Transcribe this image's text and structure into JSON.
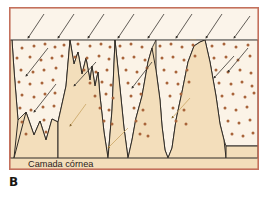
{
  "figure": {
    "panel_label": "B",
    "caption": "Camada córnea",
    "caption_position": {
      "x": 28,
      "y": 167
    },
    "frame": {
      "x": 9,
      "y": 7,
      "width": 250,
      "height": 163,
      "border_color": "#c4705c",
      "border_width": 1.6
    },
    "colors": {
      "outer_background": "#ffffff",
      "upper_band_fill": "#fbf4ea",
      "cell_region_fill": "#fbf3e7",
      "keratin_fill": "#f3debb",
      "dot_color": "#a8643a",
      "outline_color": "#2f2b26",
      "boundary_line_color": "#8d8b86",
      "arrow_dark": "#3a3631",
      "arrow_tan": "#c9a463",
      "text_color": "#2b2119",
      "frame_border": "#c4705c"
    },
    "boundary_line": {
      "y": 39.5,
      "segments": [
        [
          10,
          190
        ],
        [
          196,
          258
        ]
      ]
    }
  },
  "chart_data": {
    "type": "diagram",
    "title": "Camada córnea",
    "keratin_polygons": [
      {
        "name": "left-edge-spur",
        "points": "10,40 10,158 14,158 18,120 14,70 12,40"
      },
      {
        "name": "left-valley-mound",
        "points": "14,158 26,112 34,135 40,121 46,140 52,119 58,122 58,158"
      },
      {
        "name": "central-triple-peak",
        "points": "58,158 58,122 62,104 66,86 70,40 74,64 78,52 82,74 86,58 90,80 92,66 95,86 98,72 100,96 104,132 108,158"
      },
      {
        "name": "mid-spike",
        "points": "108,158 112,110 115,40 120,88 124,128 128,158"
      },
      {
        "name": "center-wide-peak",
        "points": "128,158 132,140 136,118 142,96 148,62 152,48 156,70 160,100 162,126 165,150 168,158"
      },
      {
        "name": "right-tall-peak",
        "points": "168,158 172,148 176,120 182,92 188,62 194,46 200,42 205,40 210,62 216,96 220,124 224,140 226,158"
      },
      {
        "name": "right-base",
        "points": "226,158 226,146 258,146 258,158"
      }
    ],
    "cell_regions": [
      {
        "name": "cell-wedge-1",
        "points": "12,40 14,70 18,120 26,112 34,135 40,121 46,140 52,119 58,122 62,104 66,86 70,40"
      },
      {
        "name": "cell-wedge-2",
        "points": "70,40 74,64 78,52 82,74 86,58 90,80 92,66 95,86 98,72 100,96 104,132 108,158 112,110 115,40"
      },
      {
        "name": "cell-wedge-3",
        "points": "115,40 120,88 124,128 128,158 132,140 136,118 142,96 148,62 152,48 156,40"
      },
      {
        "name": "cell-wedge-4",
        "points": "156,40 156,70 160,100 162,126 165,150 168,158 172,148 176,120 182,92 188,62 194,46 200,42 205,40"
      },
      {
        "name": "cell-wedge-5",
        "points": "205,40 210,62 216,96 220,124 224,140 226,146 258,146 258,40"
      }
    ],
    "top_arrows": [
      {
        "x1": 44,
        "y1": 14,
        "x2": 28,
        "y2": 38
      },
      {
        "x1": 74,
        "y1": 14,
        "x2": 58,
        "y2": 38
      },
      {
        "x1": 104,
        "y1": 14,
        "x2": 88,
        "y2": 38
      },
      {
        "x1": 134,
        "y1": 14,
        "x2": 118,
        "y2": 38
      },
      {
        "x1": 164,
        "y1": 14,
        "x2": 148,
        "y2": 38
      },
      {
        "x1": 192,
        "y1": 14,
        "x2": 176,
        "y2": 38
      },
      {
        "x1": 222,
        "y1": 14,
        "x2": 206,
        "y2": 38
      },
      {
        "x1": 250,
        "y1": 16,
        "x2": 234,
        "y2": 38
      }
    ],
    "inner_arrows": [
      {
        "x1": 48,
        "y1": 48,
        "x2": 26,
        "y2": 76,
        "color": "arrow_dark"
      },
      {
        "x1": 56,
        "y1": 84,
        "x2": 34,
        "y2": 112,
        "color": "arrow_dark"
      },
      {
        "x1": 86,
        "y1": 104,
        "x2": 70,
        "y2": 126,
        "color": "arrow_tan"
      },
      {
        "x1": 128,
        "y1": 128,
        "x2": 108,
        "y2": 148,
        "color": "arrow_tan"
      },
      {
        "x1": 152,
        "y1": 62,
        "x2": 132,
        "y2": 88,
        "color": "arrow_dark"
      },
      {
        "x1": 96,
        "y1": 62,
        "x2": 74,
        "y2": 86,
        "color": "arrow_dark"
      },
      {
        "x1": 190,
        "y1": 98,
        "x2": 172,
        "y2": 118,
        "color": "arrow_tan"
      },
      {
        "x1": 248,
        "y1": 48,
        "x2": 228,
        "y2": 72,
        "color": "arrow_dark"
      },
      {
        "x1": 234,
        "y1": 56,
        "x2": 214,
        "y2": 78,
        "color": "arrow_dark"
      }
    ],
    "dots": [
      {
        "x": 22,
        "y": 48
      },
      {
        "x": 34,
        "y": 46
      },
      {
        "x": 45,
        "y": 44
      },
      {
        "x": 55,
        "y": 47
      },
      {
        "x": 64,
        "y": 45
      },
      {
        "x": 17,
        "y": 58
      },
      {
        "x": 30,
        "y": 57
      },
      {
        "x": 41,
        "y": 60
      },
      {
        "x": 52,
        "y": 58
      },
      {
        "x": 62,
        "y": 56
      },
      {
        "x": 21,
        "y": 70
      },
      {
        "x": 33,
        "y": 72
      },
      {
        "x": 44,
        "y": 70
      },
      {
        "x": 56,
        "y": 68
      },
      {
        "x": 19,
        "y": 82
      },
      {
        "x": 30,
        "y": 84
      },
      {
        "x": 42,
        "y": 83
      },
      {
        "x": 53,
        "y": 80
      },
      {
        "x": 22,
        "y": 95
      },
      {
        "x": 34,
        "y": 97
      },
      {
        "x": 45,
        "y": 94
      },
      {
        "x": 55,
        "y": 93
      },
      {
        "x": 20,
        "y": 108
      },
      {
        "x": 31,
        "y": 110
      },
      {
        "x": 43,
        "y": 107
      },
      {
        "x": 54,
        "y": 106
      },
      {
        "x": 22,
        "y": 122
      },
      {
        "x": 44,
        "y": 120
      },
      {
        "x": 26,
        "y": 134
      },
      {
        "x": 46,
        "y": 132
      },
      {
        "x": 78,
        "y": 44
      },
      {
        "x": 90,
        "y": 46
      },
      {
        "x": 101,
        "y": 44
      },
      {
        "x": 110,
        "y": 47
      },
      {
        "x": 75,
        "y": 57
      },
      {
        "x": 87,
        "y": 58
      },
      {
        "x": 99,
        "y": 56
      },
      {
        "x": 109,
        "y": 59
      },
      {
        "x": 84,
        "y": 70
      },
      {
        "x": 96,
        "y": 72
      },
      {
        "x": 107,
        "y": 70
      },
      {
        "x": 90,
        "y": 83
      },
      {
        "x": 102,
        "y": 82
      },
      {
        "x": 111,
        "y": 85
      },
      {
        "x": 95,
        "y": 96
      },
      {
        "x": 106,
        "y": 94
      },
      {
        "x": 113,
        "y": 98
      },
      {
        "x": 100,
        "y": 108
      },
      {
        "x": 109,
        "y": 110
      },
      {
        "x": 104,
        "y": 121
      },
      {
        "x": 112,
        "y": 124
      },
      {
        "x": 120,
        "y": 46
      },
      {
        "x": 131,
        "y": 44
      },
      {
        "x": 142,
        "y": 47
      },
      {
        "x": 123,
        "y": 58
      },
      {
        "x": 134,
        "y": 57
      },
      {
        "x": 145,
        "y": 60
      },
      {
        "x": 126,
        "y": 70
      },
      {
        "x": 137,
        "y": 72
      },
      {
        "x": 147,
        "y": 68
      },
      {
        "x": 128,
        "y": 83
      },
      {
        "x": 139,
        "y": 84
      },
      {
        "x": 131,
        "y": 96
      },
      {
        "x": 141,
        "y": 94
      },
      {
        "x": 134,
        "y": 108
      },
      {
        "x": 143,
        "y": 110
      },
      {
        "x": 136,
        "y": 121
      },
      {
        "x": 145,
        "y": 124
      },
      {
        "x": 140,
        "y": 134
      },
      {
        "x": 148,
        "y": 136
      },
      {
        "x": 160,
        "y": 46
      },
      {
        "x": 171,
        "y": 44
      },
      {
        "x": 182,
        "y": 47
      },
      {
        "x": 193,
        "y": 45
      },
      {
        "x": 162,
        "y": 58
      },
      {
        "x": 173,
        "y": 57
      },
      {
        "x": 184,
        "y": 60
      },
      {
        "x": 195,
        "y": 56
      },
      {
        "x": 164,
        "y": 70
      },
      {
        "x": 176,
        "y": 72
      },
      {
        "x": 187,
        "y": 70
      },
      {
        "x": 167,
        "y": 83
      },
      {
        "x": 178,
        "y": 84
      },
      {
        "x": 189,
        "y": 82
      },
      {
        "x": 170,
        "y": 96
      },
      {
        "x": 181,
        "y": 94
      },
      {
        "x": 173,
        "y": 108
      },
      {
        "x": 184,
        "y": 110
      },
      {
        "x": 176,
        "y": 121
      },
      {
        "x": 186,
        "y": 124
      },
      {
        "x": 212,
        "y": 46
      },
      {
        "x": 224,
        "y": 44
      },
      {
        "x": 236,
        "y": 47
      },
      {
        "x": 248,
        "y": 45
      },
      {
        "x": 214,
        "y": 58
      },
      {
        "x": 226,
        "y": 57
      },
      {
        "x": 238,
        "y": 60
      },
      {
        "x": 250,
        "y": 56
      },
      {
        "x": 216,
        "y": 70
      },
      {
        "x": 228,
        "y": 72
      },
      {
        "x": 240,
        "y": 70
      },
      {
        "x": 251,
        "y": 73
      },
      {
        "x": 219,
        "y": 83
      },
      {
        "x": 231,
        "y": 84
      },
      {
        "x": 242,
        "y": 82
      },
      {
        "x": 252,
        "y": 86
      },
      {
        "x": 222,
        "y": 96
      },
      {
        "x": 233,
        "y": 94
      },
      {
        "x": 245,
        "y": 97
      },
      {
        "x": 254,
        "y": 93
      },
      {
        "x": 225,
        "y": 108
      },
      {
        "x": 236,
        "y": 110
      },
      {
        "x": 247,
        "y": 107
      },
      {
        "x": 228,
        "y": 121
      },
      {
        "x": 239,
        "y": 123
      },
      {
        "x": 250,
        "y": 120
      },
      {
        "x": 232,
        "y": 134
      },
      {
        "x": 243,
        "y": 136
      },
      {
        "x": 253,
        "y": 133
      }
    ],
    "dot_radius": 1.5
  }
}
